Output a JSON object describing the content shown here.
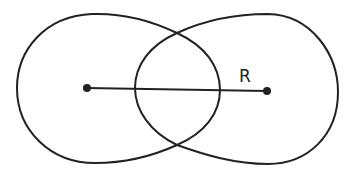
{
  "diagram": {
    "label_R": "R",
    "stroke_color": "#222222",
    "background": "#ffffff",
    "points": {
      "left_center": [
        87,
        88
      ],
      "right_center": [
        267,
        91
      ]
    }
  }
}
